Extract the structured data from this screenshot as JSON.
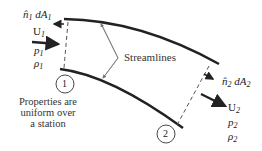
{
  "station1": {
    "normal_label": "n̂",
    "normal_sub": "1",
    "area_label": " dA",
    "area_sub": "1",
    "velocity_label": "U",
    "velocity_sub": "1",
    "pressure_label": "p",
    "pressure_sub": "1",
    "density_label": "ρ",
    "density_sub": "1",
    "circle_label": "1"
  },
  "station2": {
    "normal_label": "n̂",
    "normal_sub": "2",
    "area_label": " dA",
    "area_sub": "2",
    "velocity_label": "U",
    "velocity_sub": "2",
    "pressure_label": "p",
    "pressure_sub": "2",
    "density_label": "ρ",
    "density_sub": "2",
    "circle_label": "2"
  },
  "streamlines_label": "Streamlines",
  "note_lines": [
    "Properties are",
    "uniform over",
    "a station"
  ],
  "colors": {
    "line": "#222222",
    "leader": "#777777"
  }
}
